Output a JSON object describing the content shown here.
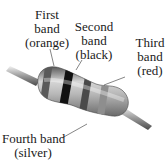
{
  "diagram": {
    "labels": [
      {
        "id": "first",
        "line1": "First",
        "line2": "band",
        "line3": "(orange)"
      },
      {
        "id": "second",
        "line1": "Second",
        "line2": "band",
        "line3": "(black)"
      },
      {
        "id": "third",
        "line1": "Third",
        "line2": "band",
        "line3": "(red)"
      },
      {
        "id": "fourth",
        "line1": "Fourth band",
        "line2": "(silver)"
      }
    ]
  }
}
